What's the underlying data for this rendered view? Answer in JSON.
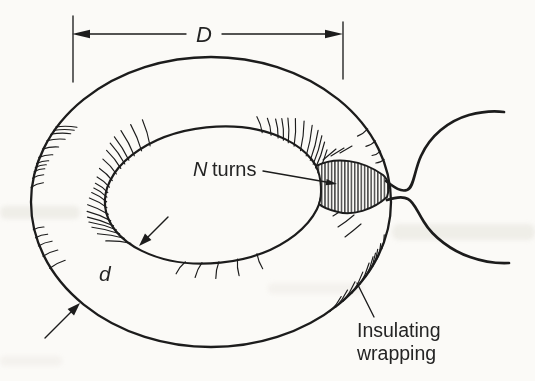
{
  "figure": {
    "background": "#fbfaf7",
    "ink": "#1c1c1c",
    "text_color": "#242424",
    "labels": {
      "diameter": "D",
      "turns_symbol": "N",
      "turns_word": "turns",
      "core_diameter": "d",
      "wrapping_line1": "Insulating",
      "wrapping_line2": "wrapping"
    }
  }
}
